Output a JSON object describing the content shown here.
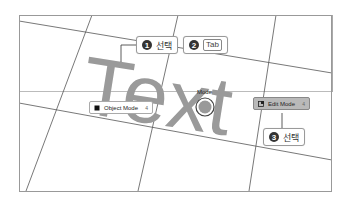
{
  "scene": {
    "text_object": "Text",
    "colors": {
      "text_gray": "#9a9a9a",
      "grid_line": "#555555",
      "border": "#888888"
    }
  },
  "pie_menu": {
    "title": "Mode",
    "items": [
      {
        "label": "Object Mode",
        "hotkey": "4",
        "icon": "object-mode-icon",
        "selected": false
      },
      {
        "label": "Edit Mode",
        "hotkey": "4",
        "icon": "edit-mode-icon",
        "selected": true
      }
    ]
  },
  "callouts": [
    {
      "number": "1",
      "text": "선택"
    },
    {
      "number": "2",
      "key": "Tab"
    },
    {
      "number": "3",
      "text": "선택"
    }
  ]
}
